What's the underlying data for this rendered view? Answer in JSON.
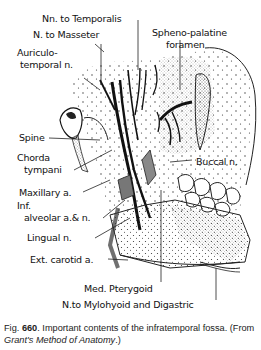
{
  "figure": {
    "labels": {
      "nn_to_temporalis": "Nn. to Temporalis",
      "n_to_masseter": "N. to Masseter",
      "auriculotemporal_1": "Auriculo-",
      "auriculotemporal_2": "temporal n.",
      "spheno_palatine_1": "Spheno-palatine",
      "spheno_palatine_2": "foramen",
      "spine": "Spine",
      "chorda_1": "Chorda",
      "chorda_2": "tympani",
      "buccal": "Buccal n.",
      "maxillary": "Maxillary a.",
      "inf_alveolar_1": "Inf.",
      "inf_alveolar_2": "alveolar a.& n.",
      "lingual": "Lingual n.",
      "ext_carotid": "Ext. carotid a.",
      "med_pterygoid": "Med. Pterygoid",
      "n_to_mylohyoid": "N.to Mylohyoid and Digastric"
    }
  },
  "caption": {
    "fig_prefix": "Fig.",
    "fig_number": "660",
    "text": ". Important contents of the infratemporal fossa. (From ",
    "source": "Grant's Method of Anatomy",
    "suffix": ".)"
  }
}
